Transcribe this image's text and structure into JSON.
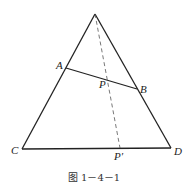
{
  "figure": {
    "caption": "图 1－4－1",
    "points": {
      "A": "A",
      "B": "B",
      "C": "C",
      "D": "D",
      "P": "P",
      "P_prime": "P′"
    },
    "colors": {
      "stroke": "#222222",
      "dashed": "#555555",
      "background": "#ffffff"
    }
  }
}
